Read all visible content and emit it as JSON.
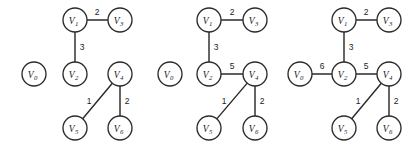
{
  "figure": {
    "background_color": "#ffffff",
    "stroke_color": "#2b2b2b",
    "text_color": "#1c1c1c",
    "node_radius": 12,
    "panel_count": 3
  },
  "chart_data": {
    "type": "diagram",
    "title": "",
    "node_ids": [
      "v0",
      "v1",
      "v2",
      "v3",
      "v4",
      "v5",
      "v6"
    ],
    "node_labels": {
      "v0": "V",
      "v1": "V",
      "v2": "V",
      "v3": "V",
      "v4": "V",
      "v5": "V",
      "v6": "V"
    },
    "node_subscripts": {
      "v0": "0",
      "v1": "1",
      "v2": "2",
      "v3": "3",
      "v4": "4",
      "v5": "5",
      "v6": "6"
    },
    "panels": [
      {
        "name": "panel-1",
        "origin_x": 0,
        "nodes": [
          {
            "id": "v0",
            "x": 34,
            "y": 74
          },
          {
            "id": "v1",
            "x": 75,
            "y": 20
          },
          {
            "id": "v2",
            "x": 75,
            "y": 74
          },
          {
            "id": "v3",
            "x": 120,
            "y": 20
          },
          {
            "id": "v4",
            "x": 120,
            "y": 74
          },
          {
            "id": "v5",
            "x": 75,
            "y": 128
          },
          {
            "id": "v6",
            "x": 120,
            "y": 128
          }
        ],
        "edges": [
          {
            "from": "v1",
            "to": "v3",
            "weight": "2",
            "label_x": 97,
            "label_y": 12
          },
          {
            "from": "v1",
            "to": "v2",
            "weight": "3",
            "label_x": 82,
            "label_y": 47
          },
          {
            "from": "v5",
            "to": "v4",
            "weight": "1",
            "label_x": 89,
            "label_y": 101
          },
          {
            "from": "v4",
            "to": "v6",
            "weight": "2",
            "label_x": 127,
            "label_y": 101
          }
        ]
      },
      {
        "name": "panel-2",
        "origin_x": 136,
        "nodes": [
          {
            "id": "v0",
            "x": 170,
            "y": 74
          },
          {
            "id": "v1",
            "x": 209,
            "y": 20
          },
          {
            "id": "v2",
            "x": 209,
            "y": 74
          },
          {
            "id": "v3",
            "x": 255,
            "y": 20
          },
          {
            "id": "v4",
            "x": 255,
            "y": 74
          },
          {
            "id": "v5",
            "x": 209,
            "y": 128
          },
          {
            "id": "v6",
            "x": 255,
            "y": 128
          }
        ],
        "edges": [
          {
            "from": "v1",
            "to": "v3",
            "weight": "2",
            "label_x": 232,
            "label_y": 12
          },
          {
            "from": "v1",
            "to": "v2",
            "weight": "3",
            "label_x": 216,
            "label_y": 47
          },
          {
            "from": "v2",
            "to": "v4",
            "weight": "5",
            "label_x": 232,
            "label_y": 66
          },
          {
            "from": "v5",
            "to": "v4",
            "weight": "1",
            "label_x": 224,
            "label_y": 101
          },
          {
            "from": "v4",
            "to": "v6",
            "weight": "2",
            "label_x": 262,
            "label_y": 101
          }
        ]
      },
      {
        "name": "panel-3",
        "origin_x": 271,
        "nodes": [
          {
            "id": "v0",
            "x": 300,
            "y": 74
          },
          {
            "id": "v1",
            "x": 344,
            "y": 20
          },
          {
            "id": "v2",
            "x": 344,
            "y": 74
          },
          {
            "id": "v3",
            "x": 389,
            "y": 20
          },
          {
            "id": "v4",
            "x": 389,
            "y": 74
          },
          {
            "id": "v5",
            "x": 344,
            "y": 128
          },
          {
            "id": "v6",
            "x": 389,
            "y": 128
          }
        ],
        "edges": [
          {
            "from": "v1",
            "to": "v3",
            "weight": "2",
            "label_x": 366,
            "label_y": 12
          },
          {
            "from": "v1",
            "to": "v2",
            "weight": "3",
            "label_x": 351,
            "label_y": 47
          },
          {
            "from": "v0",
            "to": "v2",
            "weight": "6",
            "label_x": 322,
            "label_y": 66
          },
          {
            "from": "v2",
            "to": "v4",
            "weight": "5",
            "label_x": 366,
            "label_y": 66
          },
          {
            "from": "v5",
            "to": "v4",
            "weight": "1",
            "label_x": 358,
            "label_y": 101
          },
          {
            "from": "v4",
            "to": "v6",
            "weight": "2",
            "label_x": 396,
            "label_y": 101
          }
        ]
      }
    ]
  }
}
